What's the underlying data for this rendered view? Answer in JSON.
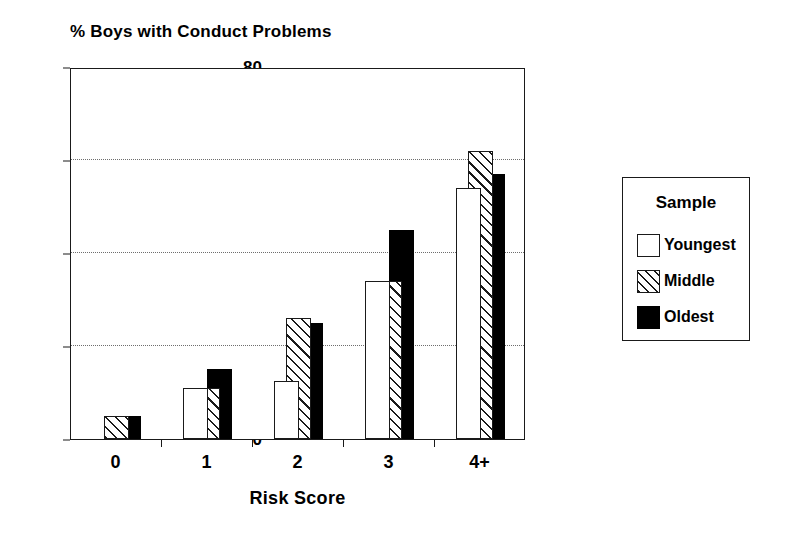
{
  "chart_data": {
    "type": "bar",
    "title": "% Boys with Conduct Problems",
    "xlabel": "Risk Score",
    "ylabel": "",
    "categories": [
      "0",
      "1",
      "2",
      "3",
      "4+"
    ],
    "series": [
      {
        "name": "Youngest",
        "values": [
          0,
          11,
          12.5,
          34,
          54
        ],
        "fill": "white"
      },
      {
        "name": "Middle",
        "values": [
          5,
          11,
          26,
          34,
          62
        ],
        "fill": "hatched"
      },
      {
        "name": "Oldest",
        "values": [
          5,
          15,
          25,
          45,
          57
        ],
        "fill": "black"
      }
    ],
    "ylim": [
      0,
      80
    ],
    "yticks": [
      0,
      20,
      40,
      60,
      80
    ],
    "gridlines": [
      20,
      40,
      60
    ],
    "grid": true,
    "legend": {
      "title": "Sample",
      "position": "right-outside"
    },
    "colors": {
      "youngest": "#ffffff",
      "middle": "#ffffff",
      "oldest": "#000000",
      "outline": "#1a1a1a",
      "grid": "#6e6e6e"
    }
  },
  "legend": {
    "title": "Sample",
    "entries": [
      {
        "label": "Youngest",
        "swatch": "white-square-icon"
      },
      {
        "label": "Middle",
        "swatch": "hatched-square-icon"
      },
      {
        "label": "Oldest",
        "swatch": "black-square-icon"
      }
    ]
  }
}
